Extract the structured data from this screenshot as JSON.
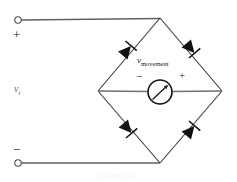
{
  "figure": {
    "type": "schematic",
    "background": "#ffffff",
    "wire_color": "#555555",
    "ink_color": "#1a1a1a"
  },
  "labels": {
    "input_source": "v",
    "input_source_sub": "i",
    "terminal_plus": "+",
    "terminal_minus": "−",
    "meter_label": "v",
    "meter_label_sub": "movement",
    "meter_minus": "−",
    "meter_plus": "+",
    "bottom_caption": "FIGURE 2.62"
  },
  "nodes": [
    {
      "name": "terminal-positive",
      "x": 18,
      "y": 20
    },
    {
      "name": "terminal-negative",
      "x": 18,
      "y": 163
    },
    {
      "name": "bridge-top",
      "x": 160,
      "y": 18
    },
    {
      "name": "bridge-left",
      "x": 98,
      "y": 91
    },
    {
      "name": "bridge-right",
      "x": 222,
      "y": 91
    },
    {
      "name": "bridge-bottom",
      "x": 160,
      "y": 163
    }
  ],
  "diodes": [
    {
      "name": "diode-top-left",
      "x": 128,
      "y": 49,
      "angle": -49.5,
      "direction": "toward-top-node"
    },
    {
      "name": "diode-top-right",
      "x": 192,
      "y": 49,
      "angle": 49.5,
      "direction": "toward-right-node"
    },
    {
      "name": "diode-bottom-left",
      "x": 128,
      "y": 129,
      "angle": 49.5,
      "direction": "toward-bottom-node"
    },
    {
      "name": "diode-bottom-right",
      "x": 192,
      "y": 129,
      "angle": -49.5,
      "direction": "toward-right-node"
    }
  ],
  "meter": {
    "name": "meter-movement",
    "cx": 160,
    "cy": 92,
    "r": 12,
    "needle_angle_deg": -48
  }
}
